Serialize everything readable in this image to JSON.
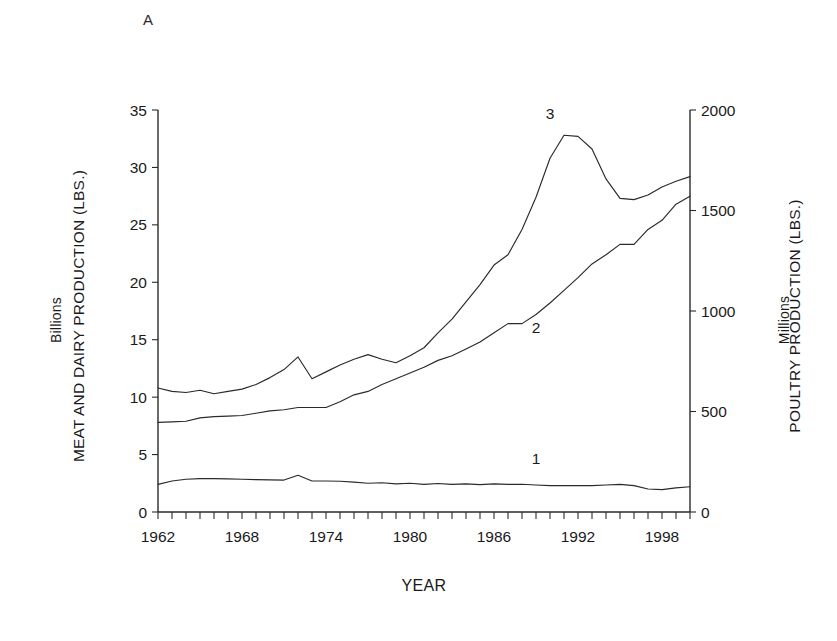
{
  "figure": {
    "panel_label": "A"
  },
  "axes": {
    "x": {
      "title": "YEAR",
      "tick_labels": [
        "1962",
        "1968",
        "1974",
        "1980",
        "1986",
        "1992",
        "1998"
      ],
      "tick_values": [
        1962,
        1968,
        1974,
        1980,
        1986,
        1992,
        1998
      ],
      "range": [
        1962,
        2000
      ],
      "minor_tick_step": 1
    },
    "y_left": {
      "title": "MEAT AND DAIRY PRODUCTION (LBS.)",
      "subtitle": "Billions",
      "tick_labels": [
        "0",
        "5",
        "10",
        "15",
        "20",
        "25",
        "30",
        "35"
      ],
      "tick_values": [
        0,
        5,
        10,
        15,
        20,
        25,
        30,
        35
      ],
      "range": [
        0,
        35
      ]
    },
    "y_right": {
      "title": "POULTRY PRODUCTION (LBS.)",
      "subtitle": "Millions",
      "tick_labels": [
        "0",
        "500",
        "1000",
        "1500",
        "2000"
      ],
      "tick_values": [
        0,
        500,
        1000,
        1500,
        2000
      ],
      "range": [
        0,
        2000
      ]
    }
  },
  "series_labels": [
    {
      "text": "1",
      "x": 1989,
      "y": 4.2
    },
    {
      "text": "2",
      "x": 1989,
      "y": 15.6
    },
    {
      "text": "3",
      "x": 1990,
      "y": 34.2
    }
  ],
  "chart_data": {
    "type": "line",
    "title": "",
    "subtitle": "",
    "panel_label": "A",
    "xlabel": "YEAR",
    "ylabel": "MEAT AND DAIRY PRODUCTION (LBS.)",
    "ylabel_secondary": "POULTRY PRODUCTION (LBS.)",
    "y_units": "Billions",
    "y_units_secondary": "Millions",
    "xlim": [
      1962,
      2000
    ],
    "ylim": [
      0,
      35
    ],
    "ylim_secondary": [
      0,
      2000
    ],
    "grid": false,
    "legend": "inline-numbered-labels",
    "x": [
      1962,
      1963,
      1964,
      1965,
      1966,
      1967,
      1968,
      1969,
      1970,
      1971,
      1972,
      1973,
      1974,
      1975,
      1976,
      1977,
      1978,
      1979,
      1980,
      1981,
      1982,
      1983,
      1984,
      1985,
      1986,
      1987,
      1988,
      1989,
      1990,
      1991,
      1992,
      1993,
      1994,
      1995,
      1996,
      1997,
      1998,
      1999,
      2000
    ],
    "series": [
      {
        "name": "1",
        "axis": "left",
        "values": [
          2.4,
          2.7,
          2.85,
          2.9,
          2.9,
          2.88,
          2.85,
          2.82,
          2.8,
          2.78,
          3.2,
          2.7,
          2.7,
          2.68,
          2.6,
          2.5,
          2.55,
          2.45,
          2.5,
          2.4,
          2.48,
          2.4,
          2.45,
          2.38,
          2.45,
          2.4,
          2.42,
          2.35,
          2.3,
          2.3,
          2.3,
          2.3,
          2.35,
          2.4,
          2.3,
          2.0,
          1.95,
          2.1,
          2.2
        ]
      },
      {
        "name": "2",
        "axis": "left",
        "values": [
          7.8,
          7.85,
          7.9,
          8.2,
          8.3,
          8.35,
          8.4,
          8.6,
          8.8,
          8.9,
          9.1,
          9.1,
          9.1,
          9.6,
          10.2,
          10.5,
          11.1,
          11.6,
          12.1,
          12.6,
          13.2,
          13.6,
          14.2,
          14.8,
          15.6,
          16.4,
          16.4,
          17.2,
          18.2,
          19.3,
          20.4,
          21.6,
          22.4,
          23.3,
          23.3,
          24.6,
          25.4,
          26.8,
          27.5
        ]
      },
      {
        "name": "3",
        "axis": "left",
        "values": [
          10.8,
          10.5,
          10.4,
          10.6,
          10.3,
          10.5,
          10.7,
          11.1,
          11.7,
          12.4,
          13.5,
          11.6,
          12.2,
          12.8,
          13.3,
          13.7,
          13.3,
          13.0,
          13.6,
          14.3,
          15.6,
          16.8,
          18.3,
          19.8,
          21.5,
          22.4,
          24.6,
          27.4,
          30.8,
          32.8,
          32.7,
          31.6,
          29.0,
          27.3,
          27.2,
          27.6,
          28.3,
          28.8,
          29.2
        ]
      }
    ]
  }
}
